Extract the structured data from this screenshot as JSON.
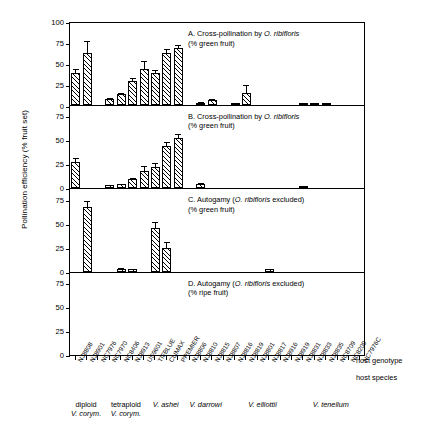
{
  "figure": {
    "y_axis_title": "Pollination efficiency (% fruit set)",
    "right_labels": {
      "genotype": "host genotype",
      "species": "host species"
    }
  },
  "chart_data": {
    "type": "bar",
    "title": "Pollination efficiency (% fruit set)",
    "xlabel": "host genotype / host species",
    "ylabel": "Pollination efficiency (% fruit set)",
    "grid": false,
    "legend": "none",
    "error_bars": "SE whiskers (upper only)",
    "categories": [
      "NJ8808",
      "NJ8901",
      "NC7976",
      "NC7970",
      "NC8406",
      "NJ8913",
      "US9601",
      "TIFBLUE",
      "CLIMAX",
      "PREMIER",
      "NJ8806",
      "NJ8810",
      "NJ8815",
      "NJ8807",
      "NJ8816",
      "NJ8819",
      "NJ8801",
      "NJ8817",
      "NJ8916",
      "NJ8919",
      "NJ8831",
      "NJ8833",
      "NJ8835",
      "NC8709",
      "NC8209",
      "NC7976C"
    ],
    "group_boundaries": [
      {
        "label": "diploid V. corym.",
        "line1": "diploid",
        "line2": "V. corym.",
        "start": 0,
        "end": 2
      },
      {
        "label": "tetraploid V. corym.",
        "line1": "tetraploid",
        "line2": "V. corym.",
        "start": 3,
        "end": 6
      },
      {
        "label": "V. ashei",
        "line1": "V. ashei",
        "line2": "",
        "start": 7,
        "end": 9
      },
      {
        "label": "V. darrowi",
        "line1": "V. darrowi",
        "line2": "",
        "start": 10,
        "end": 13
      },
      {
        "label": "V. elliottii",
        "line1": "V. elliottii",
        "line2": "",
        "start": 14,
        "end": 19
      },
      {
        "label": "V. tenellum",
        "line1": "V. tenellum",
        "line2": "",
        "start": 20,
        "end": 25
      }
    ],
    "panels": [
      {
        "id": "A",
        "caption_line1": "A. Cross-pollination by O. ribifloris",
        "caption_line2": "(% green fruit)",
        "caption_italic": "O. ribifloris",
        "ylim": [
          0,
          100
        ],
        "yticks": [
          0,
          25,
          50,
          75,
          100
        ],
        "values": [
          38,
          62,
          null,
          7,
          12,
          28,
          42,
          38,
          62,
          68,
          null,
          2,
          5,
          null,
          0.5,
          14,
          null,
          null,
          null,
          null,
          0.4,
          1.2,
          0.4,
          null,
          null,
          null
        ],
        "errors": [
          6,
          15,
          null,
          2,
          3,
          5,
          11,
          4,
          6,
          5,
          null,
          1.5,
          3,
          null,
          0.8,
          10,
          null,
          null,
          null,
          null,
          0.5,
          0.8,
          0.5,
          null,
          null,
          null
        ]
      },
      {
        "id": "B",
        "caption_line1": "B. Cross-pollination by O. ribifloris",
        "caption_line2": "(% green fruit)",
        "caption_italic": "O. ribifloris",
        "ylim": [
          0,
          87.5
        ],
        "yticks": [
          0,
          25,
          50,
          75
        ],
        "values": [
          27,
          null,
          null,
          3,
          4,
          9,
          18,
          22,
          44,
          52,
          null,
          4,
          null,
          null,
          null,
          null,
          null,
          null,
          null,
          null,
          1.5,
          null,
          null,
          null,
          null,
          null
        ],
        "errors": [
          5,
          null,
          null,
          1,
          1.5,
          3,
          6,
          5,
          5,
          6,
          null,
          2,
          null,
          null,
          null,
          null,
          null,
          null,
          null,
          null,
          0.8,
          null,
          null,
          null,
          null,
          null
        ]
      },
      {
        "id": "C",
        "caption_line1": "C. Autogamy (O. ribifloris excluded)",
        "caption_line2": "(% green fruit)",
        "caption_italic": "O. ribifloris",
        "ylim": [
          0,
          87.5
        ],
        "yticks": [
          0,
          25,
          50,
          75
        ],
        "values": [
          null,
          68,
          null,
          null,
          3,
          2.5,
          null,
          46,
          25,
          null,
          null,
          null,
          null,
          null,
          null,
          null,
          null,
          2.5,
          null,
          null,
          null,
          null,
          null,
          null,
          null,
          null
        ],
        "errors": [
          null,
          7,
          null,
          null,
          1.5,
          1.5,
          null,
          7,
          7,
          null,
          null,
          null,
          null,
          null,
          null,
          null,
          null,
          1.5,
          null,
          null,
          null,
          null,
          null,
          null,
          null,
          null
        ]
      },
      {
        "id": "D",
        "caption_line1": "D. Autogamy (O. ribifloris excluded)",
        "caption_line2": "(% ripe fruit)",
        "caption_italic": "O. ribifloris",
        "ylim": [
          0,
          87.5
        ],
        "yticks": [
          0,
          25,
          50,
          75
        ],
        "values": [
          null,
          null,
          null,
          null,
          null,
          null,
          null,
          null,
          null,
          null,
          null,
          null,
          null,
          null,
          null,
          null,
          null,
          null,
          null,
          null,
          null,
          null,
          null,
          null,
          null,
          null
        ],
        "errors": [
          null,
          null,
          null,
          null,
          null,
          null,
          null,
          null,
          null,
          null,
          null,
          null,
          null,
          null,
          null,
          null,
          null,
          null,
          null,
          null,
          null,
          null,
          null,
          null,
          null,
          null
        ]
      }
    ]
  }
}
